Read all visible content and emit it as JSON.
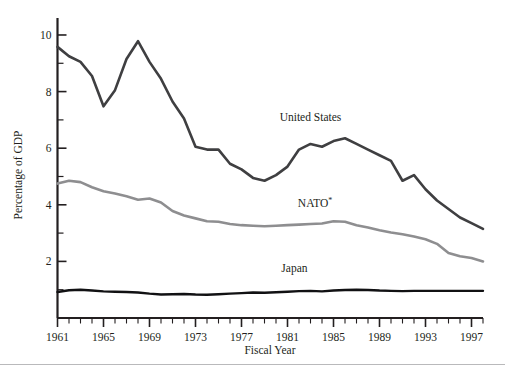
{
  "chart_data": {
    "type": "line",
    "title": "",
    "xlabel": "Fiscal Year",
    "ylabel": "Percentage of GDP",
    "xlim": [
      1961,
      1998
    ],
    "ylim": [
      0,
      10.6
    ],
    "grid": false,
    "legend_position": "inline-annotations",
    "x_major_ticks": [
      1961,
      1965,
      1969,
      1973,
      1977,
      1981,
      1985,
      1989,
      1993,
      1997
    ],
    "x_major_tick_labels": [
      "1961",
      "1965",
      "1969",
      "1973",
      "1977",
      "1981",
      "1985",
      "1989",
      "1993",
      "1997"
    ],
    "x_minor_tick_step": 1,
    "y_major_ticks": [
      2,
      4,
      6,
      8,
      10
    ],
    "y_major_tick_labels": [
      "2",
      "4",
      "6",
      "8",
      "10"
    ],
    "y_minor_ticks": [
      1,
      3,
      5,
      7,
      9
    ],
    "x": [
      1961,
      1962,
      1963,
      1964,
      1965,
      1966,
      1967,
      1968,
      1969,
      1970,
      1971,
      1972,
      1973,
      1974,
      1975,
      1976,
      1977,
      1978,
      1979,
      1980,
      1981,
      1982,
      1983,
      1984,
      1985,
      1986,
      1987,
      1988,
      1989,
      1990,
      1991,
      1992,
      1993,
      1994,
      1995,
      1996,
      1997,
      1998
    ],
    "series": [
      {
        "name": "United States",
        "color": "#3f3f41",
        "width": 2.6,
        "label_x": 1983.0,
        "label_y": 6.95,
        "values": [
          9.58,
          9.25,
          9.05,
          8.55,
          7.48,
          8.05,
          9.15,
          9.78,
          9.05,
          8.45,
          7.65,
          7.05,
          6.05,
          5.95,
          5.95,
          5.45,
          5.25,
          4.95,
          4.85,
          5.05,
          5.35,
          5.95,
          6.15,
          6.05,
          6.25,
          6.35,
          6.15,
          5.95,
          5.75,
          5.55,
          4.85,
          5.05,
          4.55,
          4.15,
          3.85,
          3.55,
          3.35,
          3.15
        ]
      },
      {
        "name": "NATO*",
        "color": "#8e8e90",
        "width": 2.6,
        "label_x": 1983.4,
        "label_y": 3.92,
        "values": [
          4.75,
          4.85,
          4.8,
          4.62,
          4.48,
          4.4,
          4.3,
          4.18,
          4.22,
          4.08,
          3.78,
          3.62,
          3.52,
          3.42,
          3.4,
          3.32,
          3.28,
          3.26,
          3.24,
          3.26,
          3.28,
          3.3,
          3.32,
          3.34,
          3.42,
          3.4,
          3.28,
          3.2,
          3.1,
          3.02,
          2.96,
          2.88,
          2.78,
          2.62,
          2.3,
          2.18,
          2.12,
          2.0
        ]
      },
      {
        "name": "Japan",
        "color": "#111113",
        "width": 2.4,
        "label_x": 1981.6,
        "label_y": 1.62,
        "values": [
          0.92,
          0.98,
          1.0,
          0.97,
          0.94,
          0.93,
          0.92,
          0.9,
          0.86,
          0.83,
          0.84,
          0.85,
          0.83,
          0.82,
          0.84,
          0.86,
          0.88,
          0.9,
          0.89,
          0.91,
          0.93,
          0.95,
          0.96,
          0.94,
          0.97,
          0.99,
          1.0,
          0.99,
          0.97,
          0.96,
          0.95,
          0.96,
          0.96,
          0.96,
          0.96,
          0.96,
          0.96,
          0.96
        ]
      }
    ]
  },
  "annotations": {
    "nato_label_base": "NATO",
    "nato_label_sup": "*"
  },
  "colors": {
    "axis": "#231f20",
    "united_states": "#3f3f41",
    "nato": "#8e8e90",
    "japan": "#111113",
    "footer_rule": "#b9b9bb",
    "background": "#ffffff"
  }
}
